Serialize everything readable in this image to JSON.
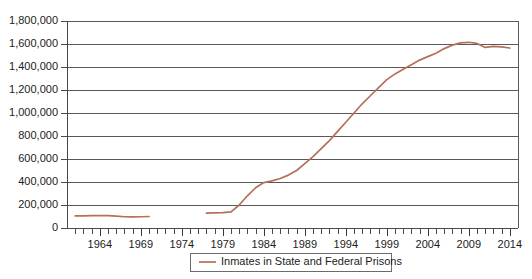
{
  "chart_data": {
    "type": "line",
    "title": "",
    "xlabel": "",
    "ylabel": "",
    "xlim": [
      1960,
      2015
    ],
    "ylim": [
      0,
      1800000
    ],
    "grid": true,
    "legend_position": "bottom",
    "y_ticks": [
      0,
      200000,
      400000,
      600000,
      800000,
      1000000,
      1200000,
      1400000,
      1600000,
      1800000
    ],
    "y_tick_labels": [
      "0",
      "200,000",
      "400,000",
      "600,000",
      "800,000",
      "1,000,000",
      "1,200,000",
      "1,400,000",
      "1,600,000",
      "1,800,000"
    ],
    "x_ticks": [
      1964,
      1969,
      1974,
      1979,
      1984,
      1989,
      1994,
      1999,
      2004,
      2009,
      2014
    ],
    "x_tick_labels": [
      "1964",
      "1969",
      "1974",
      "1979",
      "1984",
      "1989",
      "1994",
      "1999",
      "2004",
      "2009",
      "2014"
    ],
    "x_minor_tick_step": 1,
    "series": [
      {
        "name": "Inmates in State and Federal Prisons",
        "color": "#b4705a",
        "segments": [
          {
            "x": [
              1961,
              1962,
              1963,
              1964,
              1965,
              1966,
              1967,
              1968,
              1969,
              1970
            ],
            "values": [
              105000,
              106000,
              107000,
              108000,
              107000,
              103000,
              98000,
              96000,
              98000,
              100000
            ]
          },
          {
            "x": [
              1977,
              1978,
              1979,
              1980,
              1981,
              1982,
              1983,
              1984,
              1985,
              1986,
              1987,
              1988,
              1989,
              1990,
              1991,
              1992,
              1993,
              1994,
              1995,
              1996,
              1997,
              1998,
              1999,
              2000,
              2001,
              2002,
              2003,
              2004,
              2005,
              2006,
              2007,
              2008,
              2009,
              2010,
              2011,
              2012,
              2013,
              2014
            ],
            "values": [
              130000,
              131000,
              133000,
              140000,
              200000,
              280000,
              350000,
              395000,
              410000,
              430000,
              460000,
              500000,
              560000,
              620000,
              690000,
              760000,
              840000,
              920000,
              1000000,
              1080000,
              1150000,
              1220000,
              1290000,
              1340000,
              1380000,
              1420000,
              1460000,
              1490000,
              1520000,
              1560000,
              1590000,
              1610000,
              1615000,
              1605000,
              1570000,
              1580000,
              1575000,
              1565000
            ]
          }
        ]
      }
    ],
    "legend": [
      {
        "label": "Inmates in State and Federal Prisons",
        "color": "#b4705a",
        "marker": "line"
      }
    ]
  },
  "layout": {
    "plot_left": 67,
    "plot_right": 518,
    "plot_top": 21,
    "plot_bottom": 228,
    "legend_x": 190,
    "legend_y": 253,
    "legend_width": 201,
    "legend_height": 18
  },
  "colors": {
    "series_line": "#b4705a",
    "gridline": "#595959",
    "axis": "#4a4a4a",
    "text": "#1c1c1c",
    "background": "#ffffff"
  }
}
